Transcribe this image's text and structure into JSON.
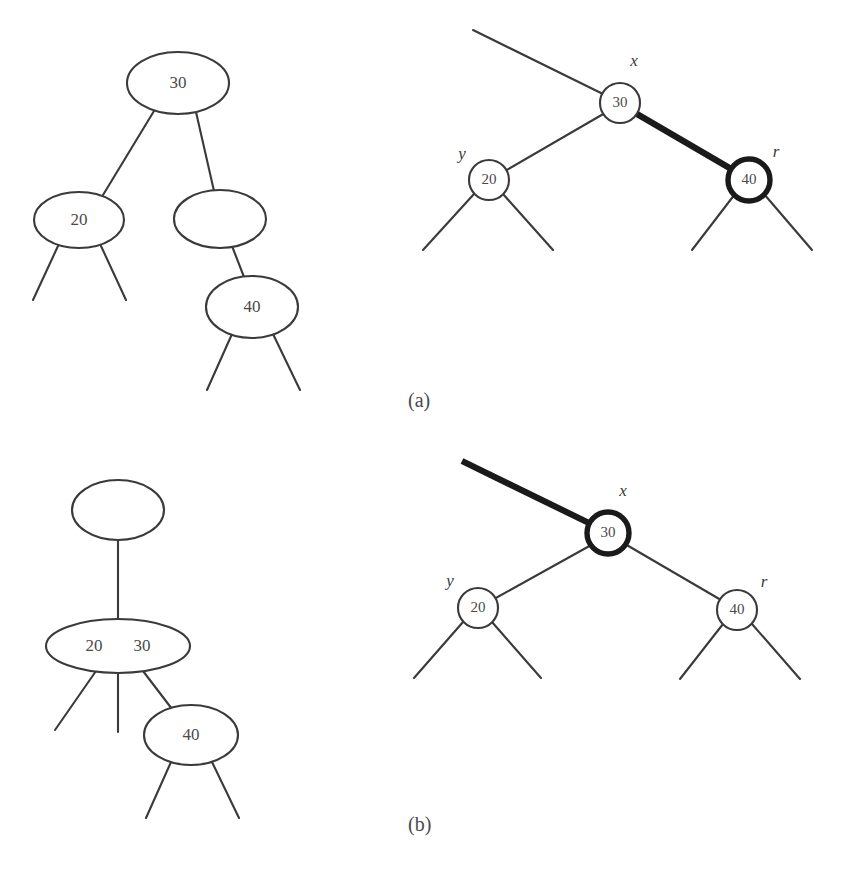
{
  "figure": {
    "background_color": "#ffffff",
    "line_color": "#3a3a3a",
    "bold_color": "#1a1a1a",
    "text_color": "#4a4a4a"
  },
  "panels": [
    {
      "caption": "(a)",
      "caption_x": 408,
      "caption_y": 402,
      "left_diagram": {
        "kind": "2-3-4-tree",
        "nodes": [
          {
            "name": "root-node-30",
            "keys": [
              "30"
            ],
            "cx": 178,
            "cy": 83,
            "rx": 51,
            "ry": 31,
            "bold": false
          },
          {
            "name": "node-20",
            "keys": [
              "20"
            ],
            "cx": 79,
            "cy": 220,
            "rx": 45,
            "ry": 28,
            "bold": false
          },
          {
            "name": "node-empty",
            "keys": [],
            "cx": 220,
            "cy": 219,
            "rx": 46,
            "ry": 29,
            "bold": false
          },
          {
            "name": "node-40",
            "keys": [
              "40"
            ],
            "cx": 252,
            "cy": 307,
            "rx": 46,
            "ry": 31,
            "bold": false
          }
        ],
        "edges": [
          {
            "name": "edge-root-to-20",
            "x1": 154,
            "y1": 111,
            "x2": 103,
            "y2": 195,
            "bold": false
          },
          {
            "name": "edge-root-to-empty",
            "x1": 196,
            "y1": 112,
            "x2": 214,
            "y2": 191,
            "bold": false
          },
          {
            "name": "edge-empty-to-40",
            "x1": 232,
            "y1": 246,
            "x2": 244,
            "y2": 277,
            "bold": false
          },
          {
            "name": "stub-20-left",
            "x1": 58,
            "y1": 246,
            "x2": 33,
            "y2": 300,
            "bold": false
          },
          {
            "name": "stub-20-right",
            "x1": 101,
            "y1": 246,
            "x2": 126,
            "y2": 300,
            "bold": false
          },
          {
            "name": "stub-40-left",
            "x1": 232,
            "y1": 334,
            "x2": 207,
            "y2": 390,
            "bold": false
          },
          {
            "name": "stub-40-right",
            "x1": 273,
            "y1": 334,
            "x2": 300,
            "y2": 390,
            "bold": false
          }
        ]
      },
      "right_diagram": {
        "kind": "red-black-tree",
        "nodes": [
          {
            "name": "node-x-30",
            "keys": [
              "30"
            ],
            "cx": 620,
            "cy": 103,
            "r": 20,
            "bold": false,
            "label": "x",
            "label_x": 634,
            "label_y": 62
          },
          {
            "name": "node-y-20",
            "keys": [
              "20"
            ],
            "cx": 489,
            "cy": 180,
            "r": 20,
            "bold": false,
            "label": "y",
            "label_x": 462,
            "label_y": 155
          },
          {
            "name": "node-r-40",
            "keys": [
              "40"
            ],
            "cx": 749,
            "cy": 180,
            "r": 21,
            "bold": true,
            "label": "r",
            "label_x": 776,
            "label_y": 153
          }
        ],
        "edges": [
          {
            "name": "edge-parent-to-x",
            "x1": 473,
            "y1": 30,
            "x2": 603,
            "y2": 94,
            "bold": false
          },
          {
            "name": "edge-x-to-y",
            "x1": 605,
            "y1": 113,
            "x2": 505,
            "y2": 171,
            "bold": false
          },
          {
            "name": "edge-x-to-r",
            "x1": 637,
            "y1": 114,
            "x2": 733,
            "y2": 170,
            "bold": true
          },
          {
            "name": "stub-y-left",
            "x1": 474,
            "y1": 194,
            "x2": 423,
            "y2": 250,
            "bold": false
          },
          {
            "name": "stub-y-right",
            "x1": 503,
            "y1": 194,
            "x2": 553,
            "y2": 250,
            "bold": false
          },
          {
            "name": "stub-r-left",
            "x1": 735,
            "y1": 194,
            "x2": 692,
            "y2": 250,
            "bold": false
          },
          {
            "name": "stub-r-right",
            "x1": 764,
            "y1": 194,
            "x2": 812,
            "y2": 250,
            "bold": false
          }
        ]
      }
    },
    {
      "caption": "(b)",
      "caption_x": 408,
      "caption_y": 826,
      "left_diagram": {
        "kind": "2-3-4-tree",
        "nodes": [
          {
            "name": "root-node-empty",
            "keys": [],
            "cx": 118,
            "cy": 510,
            "rx": 46,
            "ry": 30,
            "bold": false
          },
          {
            "name": "node-20-30",
            "keys": [
              "20",
              "30"
            ],
            "cx": 118,
            "cy": 646,
            "rx": 72,
            "ry": 27,
            "bold": false
          },
          {
            "name": "node-40",
            "keys": [
              "40"
            ],
            "cx": 191,
            "cy": 735,
            "rx": 47,
            "ry": 30,
            "bold": false
          }
        ],
        "edges": [
          {
            "name": "edge-root-to-20-30",
            "x1": 118,
            "y1": 540,
            "x2": 118,
            "y2": 619,
            "bold": false
          },
          {
            "name": "stub-node-left",
            "x1": 96,
            "y1": 671,
            "x2": 55,
            "y2": 730,
            "bold": false
          },
          {
            "name": "stub-node-middle",
            "x1": 118,
            "y1": 673,
            "x2": 118,
            "y2": 732,
            "bold": false
          },
          {
            "name": "edge-node-to-40",
            "x1": 143,
            "y1": 671,
            "x2": 172,
            "y2": 709,
            "bold": false
          },
          {
            "name": "stub-40-left",
            "x1": 171,
            "y1": 762,
            "x2": 146,
            "y2": 818,
            "bold": false
          },
          {
            "name": "stub-40-right",
            "x1": 212,
            "y1": 762,
            "x2": 239,
            "y2": 818,
            "bold": false
          }
        ]
      },
      "right_diagram": {
        "kind": "red-black-tree",
        "nodes": [
          {
            "name": "node-x-30",
            "keys": [
              "30"
            ],
            "cx": 608,
            "cy": 533,
            "r": 21,
            "bold": true,
            "label": "x",
            "label_x": 623,
            "label_y": 492
          },
          {
            "name": "node-y-20",
            "keys": [
              "20"
            ],
            "cx": 478,
            "cy": 608,
            "r": 20,
            "bold": false,
            "label": "y",
            "label_x": 450,
            "label_y": 582
          },
          {
            "name": "node-r-40",
            "keys": [
              "40"
            ],
            "cx": 737,
            "cy": 610,
            "r": 20,
            "bold": false,
            "label": "r",
            "label_x": 764,
            "label_y": 583
          }
        ],
        "edges": [
          {
            "name": "edge-parent-to-x",
            "x1": 462,
            "y1": 461,
            "x2": 591,
            "y2": 524,
            "bold": true
          },
          {
            "name": "edge-x-to-y",
            "x1": 593,
            "y1": 544,
            "x2": 494,
            "y2": 599,
            "bold": false
          },
          {
            "name": "edge-x-to-r",
            "x1": 625,
            "y1": 544,
            "x2": 721,
            "y2": 600,
            "bold": false
          },
          {
            "name": "stub-y-left",
            "x1": 463,
            "y1": 622,
            "x2": 414,
            "y2": 678,
            "bold": false
          },
          {
            "name": "stub-y-right",
            "x1": 492,
            "y1": 622,
            "x2": 541,
            "y2": 678,
            "bold": false
          },
          {
            "name": "stub-r-left",
            "x1": 723,
            "y1": 624,
            "x2": 680,
            "y2": 679,
            "bold": false
          },
          {
            "name": "stub-r-right",
            "x1": 752,
            "y1": 624,
            "x2": 800,
            "y2": 679,
            "bold": false
          }
        ]
      }
    }
  ]
}
